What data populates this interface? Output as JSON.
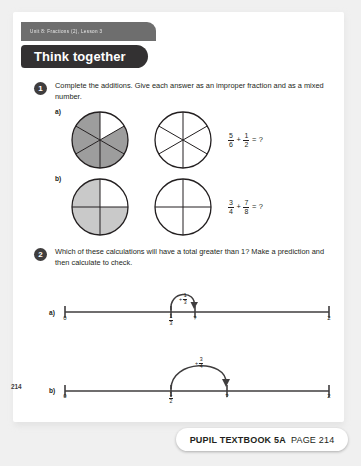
{
  "unit_tab": {
    "label": "Unit 8: Fractions (2), Lesson 3"
  },
  "banner": {
    "title": "Think together"
  },
  "questions": [
    {
      "number": "1",
      "text": "Complete the additions. Give each answer as an improper fraction and as a mixed number.",
      "parts": [
        {
          "label": "a)",
          "equation": {
            "frac1_num": "5",
            "frac1_den": "6",
            "operator": "+",
            "frac2_num": "1",
            "frac2_den": "2",
            "equals": "=",
            "answer": "?"
          },
          "diagram": {
            "type": "circle-sectors",
            "sectors": 6,
            "shaded": 5,
            "second_sectors": 6,
            "second_shaded": 0
          }
        },
        {
          "label": "b)",
          "equation": {
            "frac1_num": "3",
            "frac1_den": "4",
            "operator": "+",
            "frac2_num": "7",
            "frac2_den": "8",
            "equals": "=",
            "answer": "?"
          },
          "diagram": {
            "type": "circle-sectors",
            "sectors": 4,
            "shaded": 3,
            "second_sectors": 4,
            "second_shaded": 0
          }
        }
      ]
    },
    {
      "number": "2",
      "text": "Which of these calculations will have a total greater than 1? Make a prediction and then calculate to check.",
      "parts": [
        {
          "label": "a)",
          "numberline": {
            "start_label": "0",
            "end_label": "2",
            "tick_frac_num": "1",
            "tick_frac_den": "3",
            "unknown_label": "?",
            "jump_plus": "+",
            "jump_num": "1",
            "jump_den": "3"
          }
        },
        {
          "label": "b)",
          "numberline": {
            "start_label": "0",
            "end_label": "2",
            "tick_frac_num": "1",
            "tick_frac_den": "2",
            "unknown_label": "?",
            "jump_plus": "+",
            "jump_num": "3",
            "jump_den": "4"
          }
        }
      ]
    }
  ],
  "page_number": "214",
  "footer": {
    "book": "PUPIL TEXTBOOK 5A",
    "page": "PAGE 214"
  },
  "colors": {
    "banner_bg": "#333132",
    "tab_bg": "#6e6e6e",
    "shade": "#9d9d9d",
    "ink": "#231f20"
  }
}
